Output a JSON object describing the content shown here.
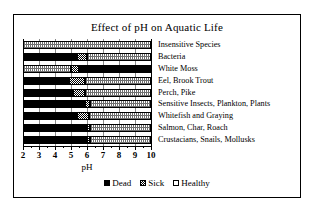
{
  "chart_data": {
    "type": "bar",
    "subtype": "stacked-horizontal-range",
    "title": "Effect of pH on Aquatic Life",
    "xlabel": "pH",
    "ylabel": "",
    "xlim": [
      2,
      10
    ],
    "xticks": [
      2,
      3,
      4,
      5,
      6,
      7,
      8,
      9,
      10
    ],
    "xtick_labels": [
      "2",
      "3",
      "4",
      "5",
      "6",
      "7",
      "8",
      "9",
      "10"
    ],
    "grid": true,
    "legend_position": "bottom",
    "legend": [
      {
        "label": "Dead",
        "key": "dead",
        "color": "#000000",
        "swatch": "solid-black"
      },
      {
        "label": "Sick",
        "key": "sick",
        "color": "#000000",
        "swatch": "checkered"
      },
      {
        "label": "Healthy",
        "key": "healthy",
        "color": "#ffffff",
        "swatch": "white-outline"
      }
    ],
    "categories": [
      "Insensitive Species",
      "Bacteria",
      "White Moss",
      "Eel, Brook Trout",
      "Perch, Pike",
      "Sensitive Insects, Plankton, Plants",
      "Whitefish and Graying",
      "Salmon, Char, Roach",
      "Crustacians, Snails, Mollusks"
    ],
    "rows": [
      {
        "category": "Insensitive Species",
        "segments": [
          {
            "state": "healthy",
            "from": 2.0,
            "to": 10.0
          }
        ]
      },
      {
        "category": "Bacteria",
        "segments": [
          {
            "state": "dead",
            "from": 2.0,
            "to": 5.4
          },
          {
            "state": "sick",
            "from": 5.4,
            "to": 6.0
          },
          {
            "state": "healthy",
            "from": 6.0,
            "to": 10.0
          }
        ]
      },
      {
        "category": "White Moss",
        "segments": [
          {
            "state": "healthy",
            "from": 2.0,
            "to": 5.0
          },
          {
            "state": "sick",
            "from": 5.0,
            "to": 5.5
          },
          {
            "state": "dead",
            "from": 5.5,
            "to": 10.0
          }
        ]
      },
      {
        "category": "Eel, Brook Trout",
        "segments": [
          {
            "state": "dead",
            "from": 2.0,
            "to": 4.9
          },
          {
            "state": "sick",
            "from": 4.9,
            "to": 5.9
          },
          {
            "state": "healthy",
            "from": 5.9,
            "to": 10.0
          }
        ]
      },
      {
        "category": "Perch, Pike",
        "segments": [
          {
            "state": "dead",
            "from": 2.0,
            "to": 5.1
          },
          {
            "state": "sick",
            "from": 5.1,
            "to": 5.9
          },
          {
            "state": "healthy",
            "from": 5.9,
            "to": 10.0
          }
        ]
      },
      {
        "category": "Sensitive Insects, Plankton, Plants",
        "segments": [
          {
            "state": "dead",
            "from": 2.0,
            "to": 5.9
          },
          {
            "state": "sick",
            "from": 5.9,
            "to": 6.2
          },
          {
            "state": "healthy",
            "from": 6.2,
            "to": 10.0
          }
        ]
      },
      {
        "category": "Whitefish and Graying",
        "segments": [
          {
            "state": "dead",
            "from": 2.0,
            "to": 5.4
          },
          {
            "state": "sick",
            "from": 5.4,
            "to": 6.1
          },
          {
            "state": "healthy",
            "from": 6.1,
            "to": 10.0
          }
        ]
      },
      {
        "category": "Salmon, Char, Roach",
        "segments": [
          {
            "state": "dead",
            "from": 2.0,
            "to": 6.0
          },
          {
            "state": "sick",
            "from": 6.0,
            "to": 6.2
          },
          {
            "state": "healthy",
            "from": 6.2,
            "to": 10.0
          }
        ]
      },
      {
        "category": "Crustacians, Snails, Mollusks",
        "segments": [
          {
            "state": "dead",
            "from": 2.0,
            "to": 6.0
          },
          {
            "state": "sick",
            "from": 6.0,
            "to": 6.2
          },
          {
            "state": "healthy",
            "from": 6.2,
            "to": 10.0
          }
        ]
      }
    ]
  }
}
